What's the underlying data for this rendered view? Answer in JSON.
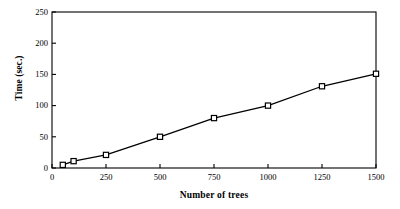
{
  "chart_data": {
    "type": "line",
    "title": "",
    "xlabel": "Number of trees",
    "ylabel": "Time (sec.)",
    "x": [
      50,
      100,
      250,
      500,
      750,
      1000,
      1250,
      1500
    ],
    "values": [
      5,
      11,
      21,
      50,
      80,
      100,
      131,
      151
    ],
    "series": [
      {
        "name": "Time",
        "values": [
          5,
          11,
          21,
          50,
          80,
          100,
          131,
          151
        ],
        "marker": "open-square",
        "line_color": "#000000",
        "marker_fill": "#ffffff",
        "marker_edge": "#000000"
      }
    ],
    "xlim": [
      0,
      1500
    ],
    "ylim": [
      0,
      250
    ],
    "xticks": [
      0,
      250,
      500,
      750,
      1000,
      1250,
      1500
    ],
    "xtick_labels": [
      "0",
      "250",
      "500",
      "750",
      "1000",
      "1250",
      "1500"
    ],
    "yticks": [
      0,
      50,
      100,
      150,
      200,
      250
    ],
    "ytick_labels": [
      "0",
      "50",
      "100",
      "150",
      "200",
      "250"
    ],
    "grid": false,
    "legend": null,
    "frame": "box",
    "background": "#ffffff"
  }
}
